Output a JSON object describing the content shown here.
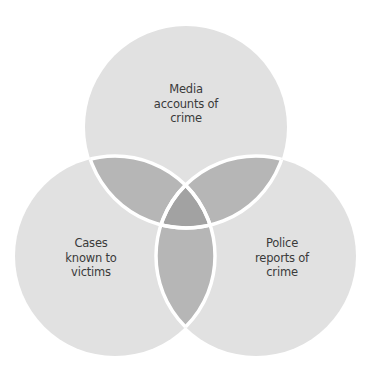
{
  "diagram": {
    "type": "venn",
    "sets": [
      {
        "id": "media",
        "label_lines": [
          "Media",
          "accounts of",
          "crime"
        ],
        "cx": 186,
        "cy": 127,
        "r": 101
      },
      {
        "id": "victims",
        "label_lines": [
          "Cases",
          "known to",
          "victims"
        ],
        "cx": 115,
        "cy": 256,
        "r": 100
      },
      {
        "id": "police",
        "label_lines": [
          "Police",
          "reports of",
          "crime"
        ],
        "cx": 256,
        "cy": 256,
        "r": 100
      }
    ],
    "colors": {
      "background": "#ffffff",
      "single": "#e1e1e1",
      "pair": "#b6b6b6",
      "triple": "#a2a2a2",
      "stroke": "#ffffff",
      "text": "#3a3a3a"
    }
  }
}
